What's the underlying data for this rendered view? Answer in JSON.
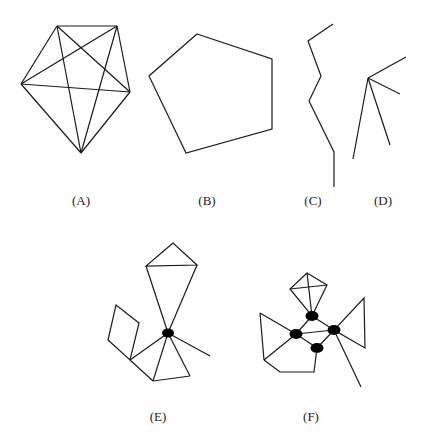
{
  "figures": [
    {
      "id": "A",
      "label": "(A)",
      "description": "Complete graph K5 drawn on pentagon vertices"
    },
    {
      "id": "B",
      "label": "(B)",
      "description": "Pentagon cycle C5"
    },
    {
      "id": "C",
      "label": "(C)",
      "description": "Path graph"
    },
    {
      "id": "D",
      "label": "(D)",
      "description": "Star graph with 4 leaves"
    },
    {
      "id": "E",
      "label": "(E)",
      "description": "Graph with one cut vertex joining blocks"
    },
    {
      "id": "F",
      "label": "(F)",
      "description": "Graph with four cut vertices highlighted"
    }
  ]
}
